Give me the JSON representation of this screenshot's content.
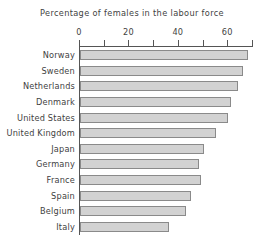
{
  "chart_data": {
    "type": "bar",
    "orientation": "horizontal",
    "title": "Percentage of females in the labour force",
    "xlabel": "",
    "ylabel": "",
    "categories": [
      "Norway",
      "Sweden",
      "Netherlands",
      "Denmark",
      "United States",
      "United Kingdom",
      "Japan",
      "Germany",
      "France",
      "Spain",
      "Belgium",
      "Italy"
    ],
    "values": [
      68,
      66,
      64,
      61,
      60,
      55,
      50,
      48,
      49,
      45,
      43,
      36
    ],
    "xlim": [
      0,
      70
    ],
    "xticks": [
      0,
      10,
      20,
      30,
      40,
      50,
      60,
      70
    ],
    "xtick_labels": [
      "0",
      "",
      "20",
      "",
      "40",
      "",
      "60",
      ""
    ],
    "grid": false,
    "legend": false,
    "bar_fill_color": "#d2d2d2",
    "bar_border_color": "#8a8a8a",
    "axis_color": "#555555",
    "text_color": "#3f3f3f"
  }
}
